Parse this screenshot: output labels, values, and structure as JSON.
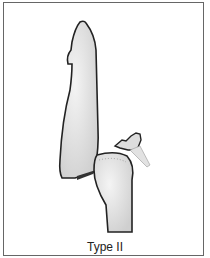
{
  "figure": {
    "caption": "Type II",
    "colors": {
      "bone_fill": "#e6e6e6",
      "outline": "#222222",
      "border": "#666666"
    }
  }
}
